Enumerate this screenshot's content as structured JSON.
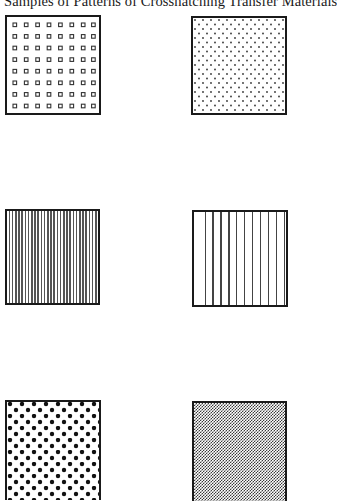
{
  "title": "Samples of Patterns of Crosshatching Transfer Materials",
  "swatches": [
    {
      "id": "hollow-squares-grid",
      "label": "Hollow square grid",
      "pattern": "squares",
      "rows": 8,
      "cols": 8
    },
    {
      "id": "fine-dot-stipple",
      "label": "Fine staggered dot stipple",
      "pattern": "fine-dots"
    },
    {
      "id": "dense-vertical-lines",
      "label": "Dense vertical lines",
      "pattern": "vlines-dense",
      "count": 30
    },
    {
      "id": "sparse-vertical-lines",
      "label": "Sparse vertical lines",
      "pattern": "vlines-sparse",
      "count": 12
    },
    {
      "id": "large-dot-stipple",
      "label": "Large staggered dots",
      "pattern": "big-dots"
    },
    {
      "id": "fine-checker",
      "label": "Fine checker screen",
      "pattern": "checker"
    }
  ],
  "colors": {
    "ink": "#1a1a1a",
    "paper": "#ffffff"
  }
}
